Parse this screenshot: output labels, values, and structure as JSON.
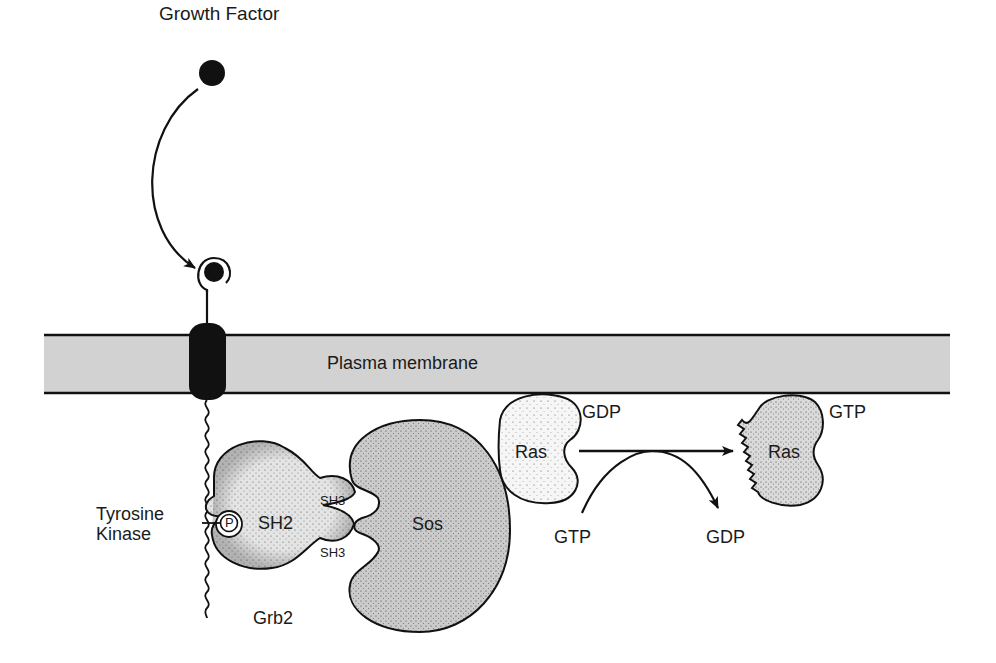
{
  "diagram": {
    "colors": {
      "membrane_fill": "#d4d4d4",
      "receptor_fill": "#111111",
      "grb2_fill": "#e2e2e2",
      "sos_fill": "#c9c9c9",
      "ras_gdp_fill": "#f4f4f4",
      "ras_gtp_fill": "#d8d8d8",
      "stroke": "#1a1a1a"
    },
    "labels": {
      "growth_factor": "Growth Factor",
      "plasma_membrane": "Plasma membrane",
      "tyrosine_kinase_line1": "Tyrosine",
      "tyrosine_kinase_line2": "Kinase",
      "phosphate": "P",
      "sh2": "SH2",
      "sh3_top": "SH3",
      "sh3_bottom": "SH3",
      "grb2": "Grb2",
      "sos": "Sos",
      "ras_inactive": "Ras",
      "ras_inactive_state": "GDP",
      "ras_active": "Ras",
      "ras_active_state": "GTP",
      "gtp_in": "GTP",
      "gdp_out": "GDP"
    },
    "nodes": [
      {
        "id": "growth-factor",
        "label": "Growth Factor"
      },
      {
        "id": "receptor",
        "label": "Tyrosine Kinase"
      },
      {
        "id": "grb2",
        "label": "Grb2",
        "domains": [
          "SH2",
          "SH3",
          "SH3"
        ]
      },
      {
        "id": "sos",
        "label": "Sos"
      },
      {
        "id": "ras-gdp",
        "label": "Ras",
        "state": "GDP"
      },
      {
        "id": "ras-gtp",
        "label": "Ras",
        "state": "GTP"
      }
    ],
    "edges": [
      {
        "from": "growth-factor",
        "to": "receptor",
        "label": "binds"
      },
      {
        "from": "ras-gdp",
        "to": "ras-gtp",
        "label": "GTP in / GDP out"
      }
    ]
  }
}
